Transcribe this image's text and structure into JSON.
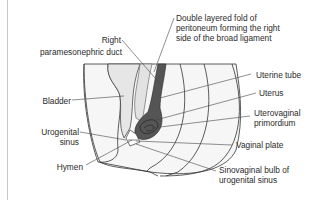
{
  "diagram": {
    "type": "anatomical",
    "colors": {
      "dark_structure": "#555555",
      "light_fill": "#ececec",
      "outline": "#333333",
      "leader": "#444444",
      "frame": "#c8c8c8"
    },
    "labels": {
      "broad_ligament": "Double layered fold of\nperitoneum forming the right\nside of the broad ligament",
      "right_duct_line1": "Right",
      "right_duct_line2": "paramesonephric duct",
      "uterine_tube": "Uterine tube",
      "uterus": "Uterus",
      "uterovaginal": "Uterovaginal\nprimordium",
      "bladder": "Bladder",
      "urogenital_sinus": "Urogenital\nsinus",
      "vaginal_plate": "Vaginal plate",
      "hymen": "Hymen",
      "sinovaginal_bulb": "Sinovaginal bulb of\nurogenital sinus"
    }
  }
}
